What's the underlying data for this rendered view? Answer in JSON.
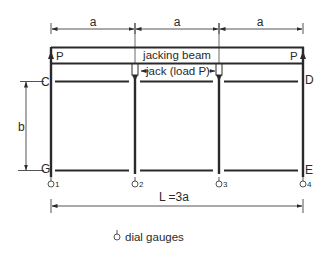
{
  "diagram": {
    "type": "test-frame-schematic",
    "colors": {
      "line": "#2a2a2a",
      "background": "#ffffff"
    },
    "dimensions": {
      "span_labels": [
        "a",
        "a",
        "a"
      ],
      "height_label": "b",
      "total_length_label": "L =3a"
    },
    "beam": {
      "label": "jacking beam"
    },
    "jack": {
      "label": "jack (load  P)"
    },
    "loads": {
      "left": "P",
      "right": "P"
    },
    "corners": {
      "top_left": "C",
      "top_right": "D",
      "bottom_left": "G",
      "bottom_right": "E"
    },
    "gauges": [
      {
        "symbol": "dial-gauge-icon",
        "number": "1"
      },
      {
        "symbol": "dial-gauge-icon",
        "number": "2"
      },
      {
        "symbol": "dial-gauge-icon",
        "number": "3"
      },
      {
        "symbol": "dial-gauge-icon",
        "number": "4"
      }
    ],
    "legend": {
      "label": "dial gauges"
    }
  }
}
